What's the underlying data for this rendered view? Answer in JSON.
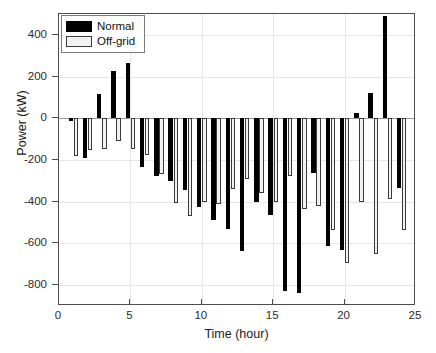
{
  "chart_data": {
    "type": "bar",
    "title": "",
    "xlabel": "Time (hour)",
    "ylabel": "Power (kW)",
    "xlim": [
      0,
      25
    ],
    "ylim": [
      -900,
      500
    ],
    "xticks": [
      0,
      5,
      10,
      15,
      20,
      25
    ],
    "yticks": [
      400,
      200,
      0,
      -200,
      -400,
      -600,
      -800
    ],
    "grid": true,
    "legend_position": "top-left",
    "x": [
      1,
      2,
      3,
      4,
      5,
      6,
      7,
      8,
      9,
      10,
      11,
      12,
      13,
      14,
      15,
      16,
      17,
      18,
      19,
      20,
      21,
      22,
      23,
      24
    ],
    "categories": [
      "1",
      "2",
      "3",
      "4",
      "5",
      "6",
      "7",
      "8",
      "9",
      "10",
      "11",
      "12",
      "13",
      "14",
      "15",
      "16",
      "17",
      "18",
      "19",
      "20",
      "21",
      "22",
      "23",
      "24"
    ],
    "series": [
      {
        "name": "Normal",
        "color": "#000000",
        "values": [
          -15,
          -190,
          115,
          225,
          265,
          -235,
          -275,
          -300,
          -345,
          -425,
          -490,
          -530,
          -635,
          -400,
          -465,
          -830,
          -840,
          -260,
          -610,
          -630,
          25,
          120,
          490,
          -335
        ]
      },
      {
        "name": "Off-grid",
        "color": "#f2f2f2",
        "values": [
          -180,
          -150,
          -145,
          -110,
          -145,
          -175,
          -265,
          -405,
          -470,
          -400,
          -410,
          -340,
          -290,
          -360,
          -400,
          -275,
          -435,
          -420,
          -535,
          -695,
          -400,
          -650,
          -385,
          -535
        ]
      }
    ]
  },
  "axis": {
    "y_tick_labels": [
      "400",
      "200",
      "0",
      "-200",
      "-400",
      "-600",
      "-800"
    ],
    "x_tick_labels": [
      "0",
      "5",
      "10",
      "15",
      "20",
      "25"
    ],
    "y_title": "Power (kW)",
    "x_title": "Time (hour)"
  },
  "legend": {
    "entries": [
      {
        "label": "Normal",
        "style": "normal"
      },
      {
        "label": "Off-grid",
        "style": "offgrid"
      }
    ]
  }
}
